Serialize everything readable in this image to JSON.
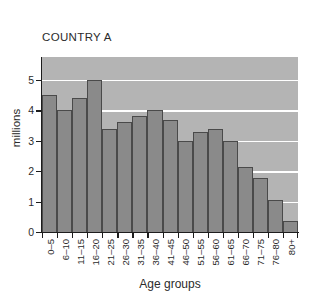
{
  "chart_data": {
    "type": "bar",
    "title": "COUNTRY A",
    "xlabel": "Age groups",
    "ylabel": "millions",
    "ylim": [
      0,
      5.75
    ],
    "yticks": [
      0,
      1,
      2,
      3,
      4,
      5
    ],
    "ytick_labels": [
      "0",
      "1",
      "2",
      "3",
      "4",
      "5"
    ],
    "grid": true,
    "gridlines_at": [
      1,
      2,
      3,
      4,
      5
    ],
    "legend": null,
    "categories": [
      "0–5",
      "6–10",
      "11–15",
      "16–20",
      "21–25",
      "26–30",
      "31–35",
      "36–40",
      "41–45",
      "46–50",
      "51–55",
      "56–60",
      "61–65",
      "66–70",
      "71–75",
      "76–80",
      "80+"
    ],
    "values": [
      4.5,
      4.0,
      4.4,
      5.0,
      3.4,
      3.6,
      3.8,
      4.0,
      3.68,
      3.0,
      3.3,
      3.38,
      3.0,
      2.15,
      1.78,
      1.05,
      0.35
    ],
    "colors": {
      "bar_fill": "#8a8a8a",
      "bar_edge": "#4a4a4a",
      "plot_background": "#b4b4b4",
      "gridline": "#ffffff",
      "axis": "#1d1d1d",
      "text": "#2b2b2b",
      "figure_background": "#ffffff"
    }
  }
}
